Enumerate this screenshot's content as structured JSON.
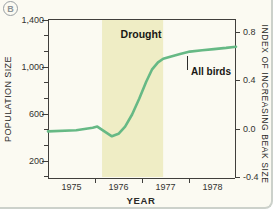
{
  "figure": {
    "panel_label": "B",
    "background_color": "#fbfaf2",
    "band_color": "#efedc5",
    "line_color": "#66b985",
    "axis_color": "#403f3c"
  },
  "chart_data": {
    "type": "line",
    "title": "",
    "xlabel": "YEAR",
    "ylabel_left": "POPULATION SIZE",
    "ylabel_right": "INDEX OF INCREASING BEAK SIZE",
    "x_axis": {
      "tick_labels": [
        "1975",
        "1976",
        "1977",
        "1978"
      ],
      "boundary_tick_years": [
        1976,
        1977,
        1978
      ],
      "range": [
        1975,
        1979
      ]
    },
    "left_axis": {
      "tick_labels": [
        "1,400",
        "1,000",
        "600",
        "200"
      ],
      "tick_values": [
        1400,
        1000,
        600,
        200
      ],
      "minor_divisions_per_interval": 3
    },
    "right_axis": {
      "tick_labels": [
        "0.8",
        "0.4",
        "0.0",
        "-0.4"
      ],
      "tick_values": [
        0.8,
        0.4,
        0.0,
        -0.4
      ],
      "range": [
        -0.4,
        0.9
      ]
    },
    "drought_band": {
      "label": "Drought",
      "x_start": 1976.15,
      "x_end": 1977.45
    },
    "series": [
      {
        "name": "All birds",
        "axis": "right",
        "points": [
          [
            1975.0,
            -0.02
          ],
          [
            1975.6,
            -0.01
          ],
          [
            1975.95,
            0.01
          ],
          [
            1976.05,
            0.02
          ],
          [
            1976.2,
            -0.02
          ],
          [
            1976.36,
            -0.06
          ],
          [
            1976.5,
            -0.04
          ],
          [
            1976.64,
            0.02
          ],
          [
            1976.79,
            0.12
          ],
          [
            1976.94,
            0.25
          ],
          [
            1977.09,
            0.39
          ],
          [
            1977.21,
            0.49
          ],
          [
            1977.34,
            0.55
          ],
          [
            1977.45,
            0.58
          ],
          [
            1977.62,
            0.6
          ],
          [
            1977.81,
            0.62
          ],
          [
            1978.02,
            0.64
          ],
          [
            1978.28,
            0.65
          ],
          [
            1978.53,
            0.66
          ],
          [
            1978.79,
            0.67
          ],
          [
            1979.0,
            0.68
          ]
        ]
      }
    ]
  }
}
